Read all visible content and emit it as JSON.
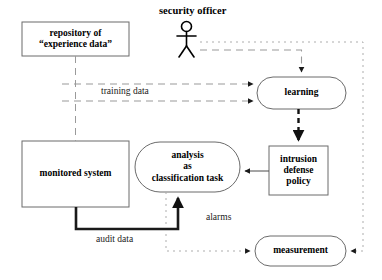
{
  "diagram": {
    "colors": {
      "stroke_solid": "#3f3f3f",
      "stroke_dashed": "#8c8c8c",
      "stroke_thick": "#1a1a1a",
      "text": "#000000",
      "background": "#ffffff"
    },
    "actor": {
      "name": "security-officer",
      "label": "security officer"
    },
    "nodes": [
      {
        "id": "repository",
        "shape": "rectangle",
        "label": "repository of\n“experience data”"
      },
      {
        "id": "monitored_system",
        "shape": "rectangle",
        "label": "monitored system"
      },
      {
        "id": "analysis",
        "shape": "rounded",
        "label": "analysis\nas\nclassification task"
      },
      {
        "id": "learning",
        "shape": "rounded",
        "label": "learning"
      },
      {
        "id": "intrusion_defense_policy",
        "shape": "rectangle",
        "label": "intrusion\ndefense\npolicy"
      },
      {
        "id": "measurement",
        "shape": "rounded",
        "label": "measurement"
      }
    ],
    "edge_labels": [
      {
        "id": "training-data",
        "label": "training data"
      },
      {
        "id": "audit-data",
        "label": "audit data"
      },
      {
        "id": "alarms",
        "label": "alarms"
      }
    ]
  }
}
